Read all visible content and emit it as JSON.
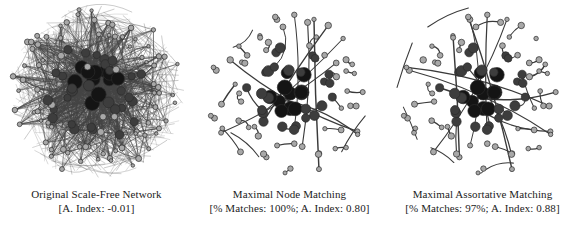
{
  "figure": {
    "background_color": "#ffffff",
    "panel_count": 3
  },
  "style": {
    "edge_color": "#3a3a3a",
    "node_stroke": "#2b2b2b",
    "node_fill_large": "#141414",
    "node_fill_medium": "#3d3d3d",
    "node_fill_small": "#a8a8a8",
    "caption_color": "#1b1b1b"
  },
  "panels": [
    {
      "id": "original-scale-free-network",
      "caption_line1": "Original Scale-Free Network",
      "caption_line2": "[A. Index: -0.01]",
      "assortativity_index": "-0.01",
      "percent_matches": null,
      "layout": "dense-circular-hairball",
      "description": "Dense scale-free network drawn as a filled disc of overlapping edges with hub nodes at the centre"
    },
    {
      "id": "maximal-node-matching",
      "caption_line1": "Maximal Node Matching",
      "caption_line2": "[% Matches: 100%; A. Index: 0.80]",
      "assortativity_index": "0.80",
      "percent_matches": "100%",
      "layout": "sparse-matching",
      "description": "Same node layout with only matched pairs retained as curved edges"
    },
    {
      "id": "maximal-assortative-matching",
      "caption_line1": "Maximal Assortative Matching",
      "caption_line2": "[% Matches: 97%; A. Index: 0.88]",
      "assortativity_index": "0.88",
      "percent_matches": "97%",
      "layout": "sparse-matching",
      "description": "Same node layout with an assortative matching retained as curved edges"
    }
  ],
  "chart_data": {
    "type": "network-diagram",
    "title": "",
    "panels": [
      {
        "name": "Original Scale-Free Network",
        "metrics": [
          {
            "label": "A. Index",
            "value": -0.01
          }
        ]
      },
      {
        "name": "Maximal Node Matching",
        "metrics": [
          {
            "label": "% Matches",
            "value": 100
          },
          {
            "label": "A. Index",
            "value": 0.8
          }
        ]
      },
      {
        "name": "Maximal Assortative Matching",
        "metrics": [
          {
            "label": "% Matches",
            "value": 97
          },
          {
            "label": "A. Index",
            "value": 0.88
          }
        ]
      }
    ]
  }
}
